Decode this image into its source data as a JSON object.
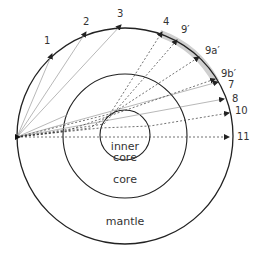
{
  "diagram": {
    "center": {
      "x": 125,
      "y": 136
    },
    "source": {
      "x": 17,
      "y": 137
    },
    "layers": [
      {
        "name": "mantle",
        "label": "mantle",
        "radius": 108
      },
      {
        "name": "core",
        "label": "core",
        "radius": 62
      },
      {
        "name": "inner-core",
        "label_line1": "inner",
        "label_line2": "core",
        "radius": 25
      }
    ],
    "shadow_zone_color": "#cccccc",
    "rays": [
      {
        "label": "1",
        "end": [
          52,
          54
        ],
        "style": "solid",
        "label_pos": [
          44,
          36
        ]
      },
      {
        "label": "2",
        "end": [
          86,
          32
        ],
        "style": "solid",
        "label_pos": [
          83,
          17
        ]
      },
      {
        "label": "3",
        "end": [
          121,
          25
        ],
        "style": "solid",
        "label_pos": [
          117,
          9
        ]
      },
      {
        "label": "4",
        "end": [
          162,
          32
        ],
        "style": "dashed",
        "label_pos": [
          163,
          17
        ]
      },
      {
        "label": "9′",
        "end": [
          177,
          40
        ],
        "style": "dashed",
        "label_pos": [
          181,
          25
        ]
      },
      {
        "label": "9a′",
        "end": [
          199,
          57
        ],
        "style": "dashed",
        "label_pos": [
          205,
          46
        ]
      },
      {
        "label": "9b′",
        "end": [
          215,
          79
        ],
        "style": "dashed",
        "label_pos": [
          221,
          69
        ]
      },
      {
        "label": "7",
        "end": [
          218,
          82
        ],
        "style": "solid",
        "label_pos": [
          228,
          80
        ]
      },
      {
        "label": "8",
        "end": [
          224,
          99
        ],
        "style": "solid",
        "label_pos": [
          232,
          94
        ]
      },
      {
        "label": "10",
        "end": [
          229,
          113
        ],
        "style": "dashed",
        "label_pos": [
          235,
          106
        ]
      },
      {
        "label": "11",
        "end": [
          229,
          137
        ],
        "style": "dashed",
        "label_pos": [
          237,
          132
        ]
      }
    ]
  },
  "labels": {
    "inner_core_1": "inner",
    "inner_core_2": "core",
    "core": "core",
    "mantle": "mantle",
    "r1": "1",
    "r2": "2",
    "r3": "3",
    "r4": "4",
    "r9p": "9′",
    "r9ap": "9a′",
    "r9bp": "9b′",
    "r7": "7",
    "r8": "8",
    "r10": "10",
    "r11": "11"
  }
}
